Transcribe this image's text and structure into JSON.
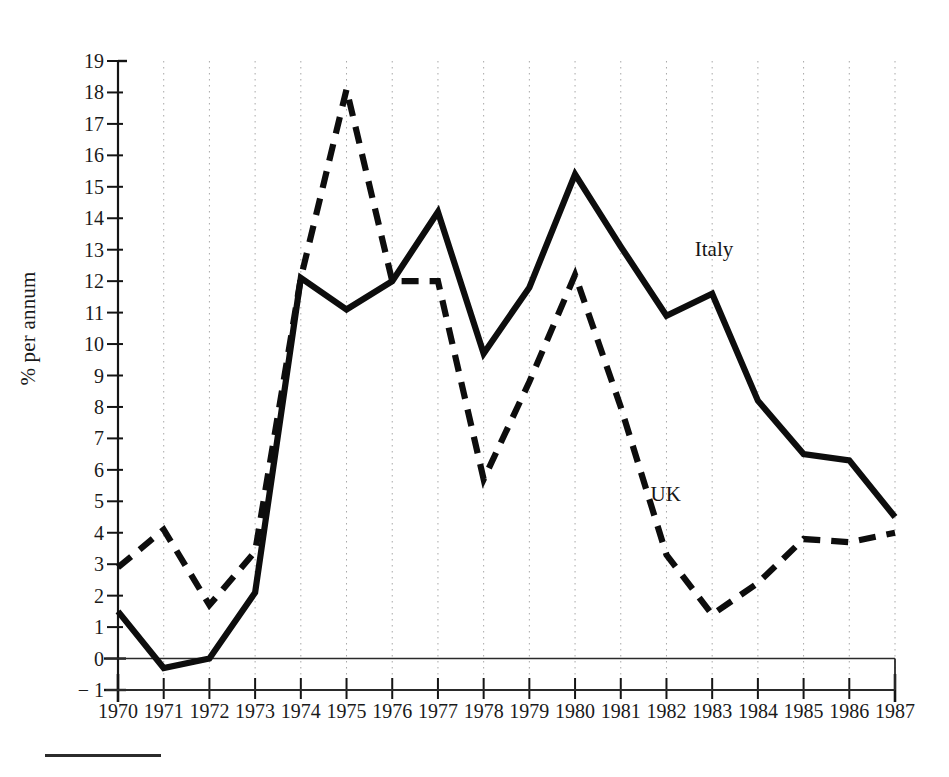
{
  "chart_data": {
    "type": "line",
    "title": "",
    "subtitle": "",
    "xlabel": "",
    "ylabel": "% per annum",
    "x": [
      1970,
      1971,
      1972,
      1973,
      1974,
      1975,
      1976,
      1977,
      1978,
      1979,
      1980,
      1981,
      1982,
      1983,
      1984,
      1985,
      1986,
      1987
    ],
    "categories": [
      "1970",
      "1971",
      "1972",
      "1973",
      "1974",
      "1975",
      "1976",
      "1977",
      "1978",
      "1979",
      "1980",
      "1981",
      "1982",
      "1983",
      "1984",
      "1985",
      "1986",
      "1987"
    ],
    "xlim": [
      1970,
      1987
    ],
    "ylim": [
      -1,
      19
    ],
    "ytick_values": [
      -1,
      0,
      1,
      2,
      3,
      4,
      5,
      6,
      7,
      8,
      9,
      10,
      11,
      12,
      13,
      14,
      15,
      16,
      17,
      18,
      19
    ],
    "ytick_labels": [
      "− 1",
      "0",
      "1",
      "2",
      "3",
      "4",
      "5",
      "6",
      "7",
      "8",
      "9",
      "10",
      "11",
      "12",
      "13",
      "14",
      "15",
      "16",
      "17",
      "18",
      "19"
    ],
    "grid": true,
    "grid_style": "dotted-vertical",
    "legend": "inline-annotation",
    "series": [
      {
        "name": "Italy",
        "style": "solid",
        "color": "#0d0d0d",
        "label_x": 1983.1,
        "label_y": 13.0,
        "values": [
          1.5,
          -0.3,
          0.0,
          2.1,
          12.1,
          11.1,
          12.0,
          14.2,
          9.7,
          11.8,
          15.4,
          13.1,
          10.9,
          11.6,
          8.2,
          6.5,
          6.3,
          4.5
        ]
      },
      {
        "name": "UK",
        "style": "dashed",
        "color": "#0d0d0d",
        "label_x": 1982.0,
        "label_y": 5.2,
        "values": [
          2.9,
          4.1,
          1.7,
          3.4,
          12.1,
          18.1,
          12.0,
          12.0,
          5.7,
          8.8,
          12.2,
          8.0,
          3.3,
          1.4,
          2.4,
          3.8,
          3.7,
          4.0
        ]
      }
    ]
  },
  "annotations": {
    "italy_label": "Italy",
    "uk_label": "UK"
  },
  "axis": {
    "y_title": "% per annum"
  }
}
